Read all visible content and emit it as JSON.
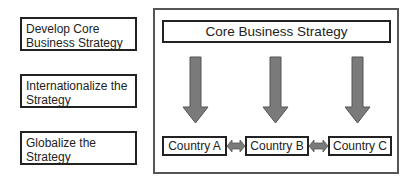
{
  "stages": [
    {
      "label": "Develop Core Business Strategy"
    },
    {
      "label": "Internationalize the Strategy"
    },
    {
      "label": "Globalize the Strategy"
    }
  ],
  "diagram": {
    "core_label": "Core Business Strategy",
    "countries": [
      {
        "label": "Country A"
      },
      {
        "label": "Country B"
      },
      {
        "label": "Country C"
      }
    ],
    "colors": {
      "arrow_fill": "#7a7a7a",
      "arrow_stroke": "#555555",
      "border": "#222222"
    }
  }
}
